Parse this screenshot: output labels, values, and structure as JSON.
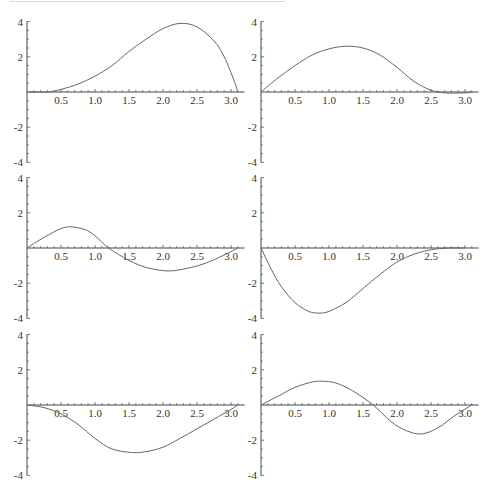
{
  "layout": {
    "rows": 3,
    "cols": 2
  },
  "axes": {
    "x_ticks": [
      0.5,
      1.0,
      1.5,
      2.0,
      2.5,
      3.0
    ],
    "x_tick_labels": [
      "0.5",
      "1.0",
      "1.5",
      "2.0",
      "2.5",
      "3.0"
    ],
    "y_ticks": [
      4,
      2,
      -2,
      -4
    ],
    "y_tick_labels": [
      "4",
      "2",
      "-2",
      "-4"
    ],
    "xlim": [
      0,
      3.2
    ],
    "ylim": [
      -4,
      4
    ]
  },
  "chart_data": [
    {
      "type": "line",
      "panel": "row1-col1",
      "title": "",
      "xlabel": "",
      "ylabel": "",
      "xlim": [
        0,
        3.2
      ],
      "ylim": [
        -4,
        4
      ],
      "x": [
        0,
        0.3,
        0.5,
        0.75,
        1.0,
        1.25,
        1.5,
        1.75,
        2.0,
        2.25,
        2.5,
        2.75,
        2.9,
        3.05,
        3.1
      ],
      "y": [
        0,
        0,
        0.15,
        0.45,
        0.9,
        1.5,
        2.3,
        3.0,
        3.6,
        3.9,
        3.7,
        2.9,
        2.0,
        0.6,
        0
      ]
    },
    {
      "type": "line",
      "panel": "row1-col2",
      "title": "",
      "xlabel": "",
      "ylabel": "",
      "xlim": [
        0,
        3.2
      ],
      "ylim": [
        -4,
        4
      ],
      "x": [
        0,
        0.25,
        0.5,
        0.75,
        1.0,
        1.25,
        1.5,
        1.75,
        2.0,
        2.25,
        2.5,
        2.7,
        3.0,
        3.1
      ],
      "y": [
        0,
        0.8,
        1.5,
        2.1,
        2.45,
        2.6,
        2.5,
        2.1,
        1.4,
        0.6,
        0.1,
        -0.05,
        -0.05,
        0
      ]
    },
    {
      "type": "line",
      "panel": "row2-col1",
      "title": "",
      "xlabel": "",
      "ylabel": "",
      "xlim": [
        0,
        3.2
      ],
      "ylim": [
        -4,
        4
      ],
      "x": [
        0,
        0.25,
        0.5,
        0.65,
        0.85,
        1.0,
        1.2,
        1.5,
        1.75,
        2.05,
        2.3,
        2.6,
        2.9,
        3.1
      ],
      "y": [
        0,
        0.6,
        1.1,
        1.2,
        1.05,
        0.7,
        0,
        -0.7,
        -1.1,
        -1.3,
        -1.2,
        -0.9,
        -0.4,
        0
      ]
    },
    {
      "type": "line",
      "panel": "row2-col2",
      "title": "",
      "xlabel": "",
      "ylabel": "",
      "xlim": [
        0,
        3.2
      ],
      "ylim": [
        -4,
        4
      ],
      "x": [
        0,
        0.15,
        0.3,
        0.5,
        0.7,
        0.85,
        1.0,
        1.25,
        1.5,
        1.75,
        2.0,
        2.25,
        2.5,
        2.75,
        3.0
      ],
      "y": [
        0,
        -1.2,
        -2.2,
        -3.1,
        -3.6,
        -3.7,
        -3.6,
        -3.1,
        -2.3,
        -1.5,
        -0.8,
        -0.35,
        -0.1,
        0,
        0
      ]
    },
    {
      "type": "line",
      "panel": "row3-col1",
      "title": "",
      "xlabel": "",
      "ylabel": "",
      "xlim": [
        0,
        3.2
      ],
      "ylim": [
        -4,
        4
      ],
      "x": [
        0,
        0.25,
        0.5,
        0.75,
        1.0,
        1.25,
        1.55,
        1.75,
        2.0,
        2.25,
        2.5,
        2.75,
        3.0,
        3.1
      ],
      "y": [
        0,
        -0.15,
        -0.5,
        -1.1,
        -1.9,
        -2.5,
        -2.7,
        -2.65,
        -2.4,
        -1.9,
        -1.35,
        -0.8,
        -0.25,
        0
      ]
    },
    {
      "type": "line",
      "panel": "row3-col2",
      "title": "",
      "xlabel": "",
      "ylabel": "",
      "xlim": [
        0,
        3.2
      ],
      "ylim": [
        -4,
        4
      ],
      "x": [
        0,
        0.25,
        0.5,
        0.75,
        0.9,
        1.1,
        1.35,
        1.65,
        1.9,
        2.1,
        2.35,
        2.6,
        2.85,
        3.1
      ],
      "y": [
        0,
        0.5,
        1.0,
        1.3,
        1.35,
        1.25,
        0.8,
        0,
        -0.9,
        -1.4,
        -1.65,
        -1.3,
        -0.6,
        0
      ]
    }
  ],
  "colors": {
    "curve": "#666666",
    "axis": "#444444",
    "background": "#ffffff"
  }
}
